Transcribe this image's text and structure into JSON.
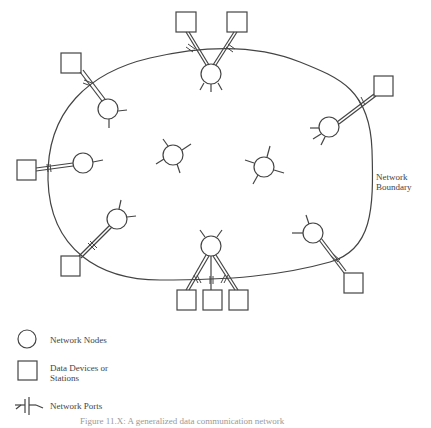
{
  "diagram": {
    "boundary_label_line1": "Network",
    "boundary_label_line2": "Boundary",
    "stroke_color": "#444444"
  },
  "legend": {
    "nodes_label": "Network Nodes",
    "devices_label_line1": "Data Devices or",
    "devices_label_line2": "Stations",
    "ports_label": "Network Ports"
  },
  "caption": "Figure 11.X: A generalized data communication network"
}
